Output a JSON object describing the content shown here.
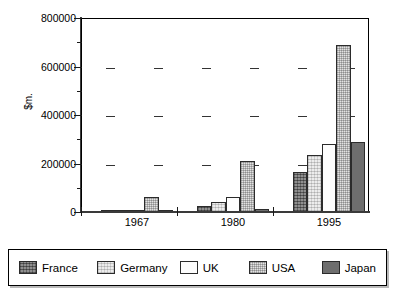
{
  "chart_data": {
    "type": "bar",
    "title": "",
    "xlabel": "",
    "ylabel": "$m.",
    "categories": [
      "1967",
      "1980",
      "1995"
    ],
    "ylim": [
      0,
      800000
    ],
    "ytick_labels": [
      "0",
      "200000",
      "400000",
      "600000",
      "800000"
    ],
    "ytick_values": [
      0,
      200000,
      400000,
      600000,
      800000
    ],
    "minor_ticks": [
      100000,
      300000,
      500000,
      700000
    ],
    "grid": "horizontal-dashed",
    "legend_position": "below-plot",
    "series": [
      {
        "name": "France",
        "values": [
          2000,
          26000,
          164000
        ]
      },
      {
        "name": "Germany",
        "values": [
          3000,
          43000,
          235000
        ]
      },
      {
        "name": "UK",
        "values": [
          9000,
          60000,
          280000
        ]
      },
      {
        "name": "USA",
        "values": [
          60000,
          210000,
          690000
        ]
      },
      {
        "name": "Japan",
        "values": [
          2000,
          12000,
          290000
        ]
      }
    ]
  },
  "legend": {
    "items": [
      {
        "label": "France",
        "swatch": "france-swatch"
      },
      {
        "label": "Germany",
        "swatch": "germany-swatch"
      },
      {
        "label": "UK",
        "swatch": "uk-swatch"
      },
      {
        "label": "USA",
        "swatch": "usa-swatch"
      },
      {
        "label": "Japan",
        "swatch": "japan-swatch"
      }
    ]
  }
}
